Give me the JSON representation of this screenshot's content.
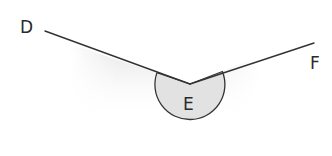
{
  "diagram": {
    "type": "reflex-angle",
    "labels": {
      "d": "D",
      "e": "E",
      "f": "F"
    },
    "points": {
      "D_label": [
        26,
        34
      ],
      "F_label": [
        316,
        69
      ],
      "E_label": [
        189,
        110
      ],
      "ray_start_D": [
        45,
        31
      ],
      "vertex_E": [
        190,
        84
      ],
      "ray_end_F": [
        314,
        43
      ]
    },
    "arc": {
      "radius": 35,
      "fill": "#e2e2e2",
      "stroke": "#333333"
    },
    "colors": {
      "line": "#333333",
      "shade": "#cfcfcf",
      "background": "#ffffff"
    }
  }
}
